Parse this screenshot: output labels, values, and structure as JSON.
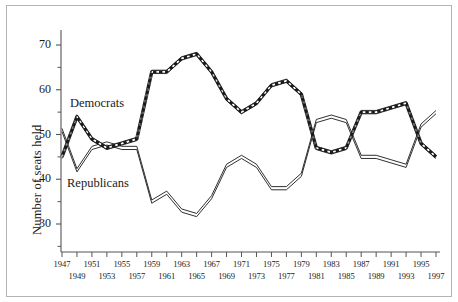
{
  "figure": {
    "ylabel": "Number of seats held",
    "series_labels": {
      "democrats": "Democrats",
      "republicans": "Republicans"
    },
    "colors": {
      "line": "#1a1a1a",
      "axis": "#555555",
      "frame": "#b4b4b4",
      "background": "#ffffff"
    }
  },
  "chart_data": {
    "type": "line",
    "title": "",
    "subtitle": "",
    "xlabel": "",
    "ylabel": "Number of seats held",
    "x": [
      1947,
      1949,
      1951,
      1953,
      1955,
      1957,
      1959,
      1961,
      1963,
      1965,
      1967,
      1969,
      1971,
      1973,
      1975,
      1977,
      1979,
      1981,
      1983,
      1985,
      1987,
      1989,
      1991,
      1993,
      1995,
      1997
    ],
    "xtick_labels_top": [
      "1947",
      "1951",
      "1955",
      "1959",
      "1963",
      "1967",
      "1971",
      "1975",
      "1979",
      "1983",
      "1987",
      "1991",
      "1995"
    ],
    "xtick_labels_bottom": [
      "1949",
      "1953",
      "1957",
      "1961",
      "1965",
      "1969",
      "1973",
      "1977",
      "1981",
      "1985",
      "1989",
      "1993",
      "1997"
    ],
    "ytick_labels": [
      "70",
      "60",
      "50",
      "40",
      "30"
    ],
    "yticks": [
      30,
      40,
      50,
      60,
      70
    ],
    "yminor_step": 5,
    "ylim": [
      26,
      73
    ],
    "xlim": [
      1946,
      1998
    ],
    "grid": false,
    "legend": "inline-annotations",
    "series": [
      {
        "name": "Democrats",
        "style": "hatched",
        "values": [
          45,
          54,
          49,
          47,
          48,
          49,
          64,
          64,
          67,
          68,
          64,
          58,
          55,
          57,
          61,
          62,
          59,
          47,
          46,
          47,
          55,
          55,
          56,
          57,
          48,
          45
        ]
      },
      {
        "name": "Republicans",
        "style": "double-outline",
        "values": [
          51,
          42,
          47,
          48,
          47,
          47,
          35,
          37,
          33,
          32,
          36,
          43,
          45,
          43,
          38,
          38,
          41,
          53,
          54,
          53,
          45,
          45,
          44,
          43,
          52,
          55
        ]
      }
    ]
  }
}
